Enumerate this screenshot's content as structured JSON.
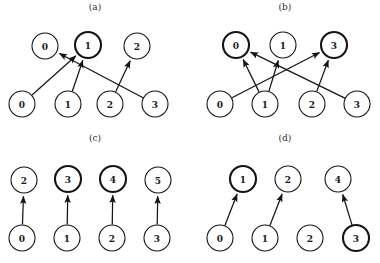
{
  "figure": {
    "width": 380,
    "height": 263,
    "background": "#ffffff",
    "stroke_color": "#141414",
    "label_color": "#2b2b2b",
    "node_radius": 13,
    "node_radius_small": 12.5
  },
  "panels": [
    {
      "id": "a",
      "label": "(a)",
      "origin": [
        0,
        0
      ],
      "size": [
        190,
        132
      ],
      "top_nodes": [
        {
          "id": "a-top-0",
          "label": "0",
          "x": 45,
          "y": 46,
          "bold": false
        },
        {
          "id": "a-top-1",
          "label": "1",
          "x": 88,
          "y": 45,
          "bold": true
        },
        {
          "id": "a-top-2",
          "label": "2",
          "x": 137,
          "y": 46,
          "bold": false
        }
      ],
      "bottom_nodes": [
        {
          "id": "a-bot-0",
          "label": "0",
          "x": 22,
          "y": 104,
          "bold": false
        },
        {
          "id": "a-bot-1",
          "label": "1",
          "x": 68,
          "y": 104,
          "bold": false
        },
        {
          "id": "a-bot-2",
          "label": "2",
          "x": 110,
          "y": 104,
          "bold": false
        },
        {
          "id": "a-bot-3",
          "label": "3",
          "x": 155,
          "y": 104,
          "bold": false
        }
      ],
      "edges": [
        {
          "from": "a-bot-0",
          "to": "a-top-1"
        },
        {
          "from": "a-bot-1",
          "to": "a-top-1"
        },
        {
          "from": "a-bot-2",
          "to": "a-top-2"
        },
        {
          "from": "a-bot-3",
          "to": "a-top-0"
        }
      ]
    },
    {
      "id": "b",
      "label": "(b)",
      "origin": [
        190,
        0
      ],
      "size": [
        190,
        132
      ],
      "top_nodes": [
        {
          "id": "b-top-0",
          "label": "0",
          "x": 236,
          "y": 45,
          "bold": true
        },
        {
          "id": "b-top-1",
          "label": "1",
          "x": 283,
          "y": 45,
          "bold": false
        },
        {
          "id": "b-top-3",
          "label": "3",
          "x": 334,
          "y": 45,
          "bold": true
        }
      ],
      "bottom_nodes": [
        {
          "id": "b-bot-0",
          "label": "0",
          "x": 220,
          "y": 104,
          "bold": false
        },
        {
          "id": "b-bot-1",
          "label": "1",
          "x": 265,
          "y": 104,
          "bold": false
        },
        {
          "id": "b-bot-2",
          "label": "2",
          "x": 312,
          "y": 104,
          "bold": false
        },
        {
          "id": "b-bot-3",
          "label": "3",
          "x": 357,
          "y": 104,
          "bold": false
        }
      ],
      "edges": [
        {
          "from": "b-bot-0",
          "to": "b-top-3"
        },
        {
          "from": "b-bot-1",
          "to": "b-top-0"
        },
        {
          "from": "b-bot-2",
          "to": "b-top-3"
        },
        {
          "from": "b-bot-3",
          "to": "b-top-0"
        },
        {
          "from": "b-bot-1",
          "to": "b-top-1"
        }
      ]
    },
    {
      "id": "c",
      "label": "(c)",
      "origin": [
        0,
        131
      ],
      "size": [
        190,
        132
      ],
      "top_nodes": [
        {
          "id": "c-top-2",
          "label": "2",
          "x": 24,
          "y": 180,
          "bold": false
        },
        {
          "id": "c-top-3",
          "label": "3",
          "x": 68,
          "y": 179,
          "bold": true
        },
        {
          "id": "c-top-4",
          "label": "4",
          "x": 113,
          "y": 179,
          "bold": true
        },
        {
          "id": "c-top-5",
          "label": "5",
          "x": 158,
          "y": 180,
          "bold": false
        }
      ],
      "bottom_nodes": [
        {
          "id": "c-bot-0",
          "label": "0",
          "x": 22,
          "y": 238,
          "bold": false
        },
        {
          "id": "c-bot-1",
          "label": "1",
          "x": 67,
          "y": 238,
          "bold": false
        },
        {
          "id": "c-bot-2",
          "label": "2",
          "x": 112,
          "y": 238,
          "bold": false
        },
        {
          "id": "c-bot-3",
          "label": "3",
          "x": 157,
          "y": 238,
          "bold": false
        }
      ],
      "edges": [
        {
          "from": "c-bot-0",
          "to": "c-top-2"
        },
        {
          "from": "c-bot-1",
          "to": "c-top-3"
        },
        {
          "from": "c-bot-2",
          "to": "c-top-4"
        },
        {
          "from": "c-bot-3",
          "to": "c-top-5"
        }
      ],
      "crossing_point": [
        90,
        208
      ]
    },
    {
      "id": "d",
      "label": "(d)",
      "origin": [
        190,
        131
      ],
      "size": [
        190,
        132
      ],
      "top_nodes": [
        {
          "id": "d-top-1",
          "label": "1",
          "x": 243,
          "y": 179,
          "bold": true
        },
        {
          "id": "d-top-2",
          "label": "2",
          "x": 288,
          "y": 179,
          "bold": false
        },
        {
          "id": "d-top-4",
          "label": "4",
          "x": 338,
          "y": 179,
          "bold": false
        }
      ],
      "bottom_nodes": [
        {
          "id": "d-bot-0",
          "label": "0",
          "x": 220,
          "y": 238,
          "bold": false
        },
        {
          "id": "d-bot-1",
          "label": "1",
          "x": 265,
          "y": 238,
          "bold": false
        },
        {
          "id": "d-bot-2",
          "label": "2",
          "x": 310,
          "y": 238,
          "bold": false
        },
        {
          "id": "d-bot-3",
          "label": "3",
          "x": 356,
          "y": 238,
          "bold": true
        }
      ],
      "edges": [
        {
          "from": "d-bot-0",
          "to": "d-top-1"
        },
        {
          "from": "d-bot-1",
          "to": "d-top-2"
        },
        {
          "from": "d-bot-3",
          "to": "d-top-4"
        }
      ]
    }
  ]
}
